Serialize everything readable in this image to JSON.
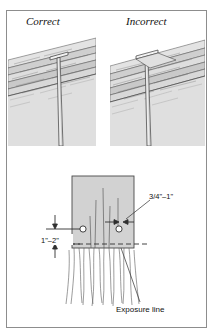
{
  "figure": {
    "top_caption": "",
    "panels": {
      "correct_label": "Correct",
      "incorrect_label": "Incorrect"
    },
    "detail": {
      "edge_dimension": "3/4\"–1\"",
      "vertical_dimension": "1\"–2\"",
      "exposure_note": "Exposure line"
    },
    "colors": {
      "frame_stroke": "#8d8d8d",
      "shingle_fill": "#d2d2d2",
      "shingle_fill_light": "#dcdcdc",
      "line_ink": "#4a4a4a",
      "text": "#111111"
    }
  }
}
